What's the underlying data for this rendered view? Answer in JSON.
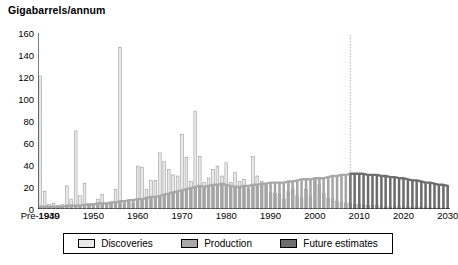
{
  "chart": {
    "title": "Gigabarrels/annum",
    "type": "bar"
  },
  "legend": {
    "items": [
      {
        "label": "Discoveries",
        "color": "#e9e9e9",
        "name": "discoveries"
      },
      {
        "label": "Production",
        "color": "#a8a8a8",
        "name": "production"
      },
      {
        "label": "Future estimates",
        "color": "#6e6e6e",
        "name": "future-estimates"
      }
    ]
  },
  "chart_data": {
    "type": "bar",
    "title": "Gigabarrels/annum",
    "xlabel": "",
    "ylabel": "Gigabarrels/annum",
    "ylim": [
      0,
      160
    ],
    "ytick_step": 20,
    "yticks": [
      0,
      20,
      40,
      60,
      80,
      100,
      120,
      140,
      160
    ],
    "grid": false,
    "legend_position": "bottom",
    "xticks": [
      "Pre-1939",
      "1940",
      "1950",
      "1960",
      "1970",
      "1980",
      "1990",
      "2000",
      "2010",
      "2020",
      "2030"
    ],
    "xtick_years": [
      1938,
      1940,
      1950,
      1960,
      1970,
      1980,
      1990,
      2000,
      2010,
      2020,
      2030
    ],
    "annotations": [
      {
        "type": "vertical-dotted-line",
        "year": 2008,
        "label": ""
      }
    ],
    "categories": [
      "Pre-1939",
      "1939",
      "1940",
      "1941",
      "1942",
      "1943",
      "1944",
      "1945",
      "1946",
      "1947",
      "1948",
      "1949",
      "1950",
      "1951",
      "1952",
      "1953",
      "1954",
      "1955",
      "1956",
      "1957",
      "1958",
      "1959",
      "1960",
      "1961",
      "1962",
      "1963",
      "1964",
      "1965",
      "1966",
      "1967",
      "1968",
      "1969",
      "1970",
      "1971",
      "1972",
      "1973",
      "1974",
      "1975",
      "1976",
      "1977",
      "1978",
      "1979",
      "1980",
      "1981",
      "1982",
      "1983",
      "1984",
      "1985",
      "1986",
      "1987",
      "1988",
      "1989",
      "1990",
      "1991",
      "1992",
      "1993",
      "1994",
      "1995",
      "1996",
      "1997",
      "1998",
      "1999",
      "2000",
      "2001",
      "2002",
      "2003",
      "2004",
      "2005",
      "2006",
      "2007",
      "2008",
      "2009",
      "2010",
      "2011",
      "2012",
      "2013",
      "2014",
      "2015",
      "2016",
      "2017",
      "2018",
      "2019",
      "2020",
      "2021",
      "2022",
      "2023",
      "2024",
      "2025",
      "2026",
      "2027",
      "2028",
      "2029",
      "2030"
    ],
    "series": [
      {
        "name": "Discoveries",
        "color": "#e9e9e9",
        "values": [
          121,
          16,
          4,
          5,
          3,
          4,
          21,
          9,
          71,
          12,
          23,
          5,
          5,
          9,
          13,
          4,
          5,
          18,
          147,
          4,
          6,
          5,
          39,
          38,
          18,
          26,
          26,
          51,
          43,
          36,
          31,
          30,
          68,
          47,
          25,
          89,
          48,
          24,
          28,
          36,
          39,
          30,
          42,
          24,
          33,
          25,
          27,
          18,
          48,
          30,
          25,
          22,
          15,
          14,
          13,
          9,
          16,
          18,
          12,
          10,
          18,
          12,
          28,
          22,
          14,
          10,
          9,
          7,
          6,
          5,
          5,
          4,
          4,
          3,
          3,
          3,
          3,
          2,
          2,
          2,
          2,
          2,
          2,
          2,
          2,
          2,
          2,
          2,
          1,
          1,
          1,
          1,
          1
        ]
      },
      {
        "name": "Production",
        "color": "#a8a8a8",
        "values": [
          2,
          2,
          2,
          2,
          2,
          2,
          3,
          3,
          3,
          3,
          4,
          4,
          4,
          5,
          5,
          5,
          6,
          6,
          7,
          7,
          8,
          8,
          9,
          9,
          10,
          11,
          11,
          12,
          13,
          14,
          15,
          16,
          17,
          18,
          19,
          20,
          21,
          20,
          21,
          22,
          22,
          23,
          22,
          21,
          20,
          20,
          21,
          21,
          22,
          22,
          23,
          23,
          24,
          24,
          24,
          24,
          25,
          25,
          26,
          27,
          27,
          27,
          28,
          28,
          28,
          29,
          30,
          30,
          31,
          31,
          32,
          32,
          32,
          32,
          31,
          31,
          31,
          30,
          30,
          29,
          29,
          28,
          28,
          27,
          26,
          26,
          25,
          24,
          24,
          23,
          22,
          22,
          21
        ]
      }
    ],
    "production_curve": {
      "name": "Production/Future estimates curve",
      "historical_color": "#a8a8a8",
      "future_color": "#6e6e6e",
      "split_year": 2008,
      "peak": {
        "year": 2008,
        "value": 32
      },
      "end": {
        "year": 2030,
        "value": 21
      }
    },
    "future_bars": {
      "name": "Future estimates",
      "color": "#6e6e6e",
      "start_year": 2008,
      "end_year": 2030,
      "values": [
        2,
        2,
        2,
        2,
        2,
        2,
        2,
        2,
        2,
        2,
        2,
        2,
        2,
        2,
        1,
        1,
        1,
        1,
        1,
        1,
        1,
        1,
        1
      ]
    }
  }
}
